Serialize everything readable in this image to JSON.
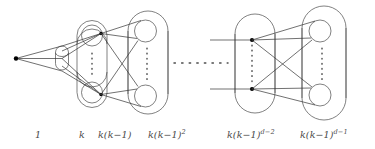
{
  "figure": {
    "background_color": "#ffffff",
    "line_color": "#4a4a4a",
    "node_color": "#000000"
  },
  "levels": [
    {
      "index": 1,
      "label": "1",
      "label_plain": "1",
      "description": "root vertex"
    },
    {
      "index": 2,
      "label": "k",
      "label_plain": "k",
      "description": "small capsule of k vertices"
    },
    {
      "index": 3,
      "label_base": "k(k−1)",
      "label_plain": "k(k-1)",
      "description": "capsule containing two circles"
    },
    {
      "index": 4,
      "label_base": "k(k−1)",
      "label_exp": "2",
      "label_plain": "k(k-1)^2",
      "description": "capsule containing two circles"
    },
    {
      "index": 5,
      "label_base": "k(k−1)",
      "label_exp": "d−2",
      "label_plain": "k(k-1)^(d-2)",
      "description": "capsule containing two vertices"
    },
    {
      "index": 6,
      "label_base": "k(k−1)",
      "label_exp": "d−1",
      "label_plain": "k(k-1)^(d-1)",
      "description": "capsule containing two circles"
    }
  ],
  "ellipsis": {
    "orientation": "horizontal",
    "meaning": "levels omitted"
  },
  "vertical_ellipses": {
    "count": 4,
    "meaning": "vertices omitted within each level"
  }
}
